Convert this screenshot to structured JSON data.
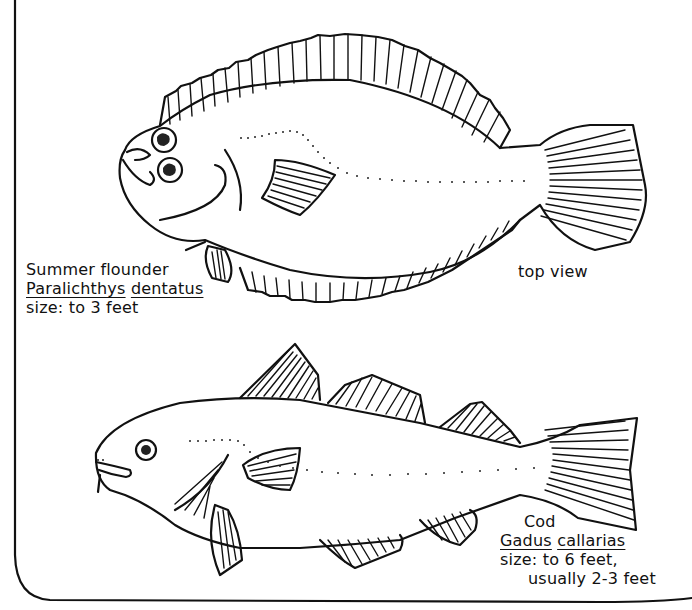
{
  "frame": {
    "stroke_color": "#111111",
    "background": "#ffffff"
  },
  "flounder": {
    "common_name": "Summer flounder",
    "genus": "Paralichthys",
    "species": "dentatus",
    "size": "size: to 3 feet",
    "view_note": "top view"
  },
  "cod": {
    "common_name": "Cod",
    "genus": "Gadus",
    "species": "callarias",
    "size_line1": "size: to 6 feet,",
    "size_line2": "usually 2-3 feet"
  }
}
